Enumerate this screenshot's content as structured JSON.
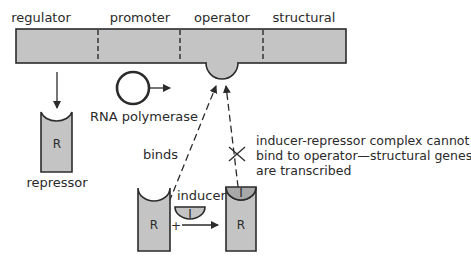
{
  "diagram": {
    "colors": {
      "fill": "#c4c4c4",
      "stroke": "#2b2b2b",
      "background": "#ffffff"
    },
    "dna_segments": [
      {
        "id": "regulator",
        "label": "regulator"
      },
      {
        "id": "promoter",
        "label": "promoter"
      },
      {
        "id": "operator",
        "label": "operator"
      },
      {
        "id": "structural",
        "label": "structural"
      }
    ],
    "repressor": {
      "symbol": "R",
      "label": "repressor"
    },
    "rna_polymerase": {
      "label": "RNA polymerase"
    },
    "binds_label": "binds",
    "inducer": {
      "label": "inducer",
      "symbol": "I"
    },
    "plus_sign": "+",
    "complex": {
      "repressor_symbol": "R",
      "inducer_symbol": "I"
    },
    "blocked_note": {
      "line1": "inducer-repressor complex cannot",
      "line2": "bind to operator—structural genes",
      "line3": "are transcribed"
    }
  }
}
